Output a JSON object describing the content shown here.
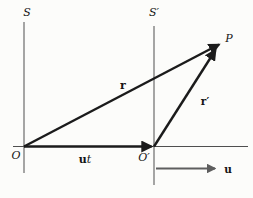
{
  "figure": {
    "labels": {
      "frame_s": "S",
      "frame_s_prime": "S′",
      "origin_o": "O",
      "origin_o_prime": "O′",
      "point_p": "P",
      "vector_r": "r",
      "vector_r_prime": "r′",
      "vector_ut_u": "u",
      "vector_ut_t": "t",
      "vector_u": "u"
    },
    "colors": {
      "background": "#fcfcfa",
      "vector": "#1b1b1b",
      "axis": "#4f4f4f",
      "u_arrow": "#5e5e5e"
    }
  }
}
